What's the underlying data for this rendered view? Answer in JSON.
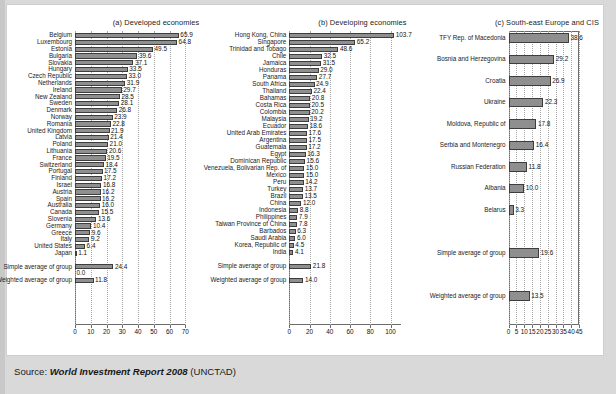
{
  "source": {
    "label": "Source: ",
    "italic_title": "World Investment Report 2008",
    "suffix": " (UNCTAD)"
  },
  "chart_data": [
    {
      "type": "bar",
      "orientation": "horizontal",
      "title": "(a) Developed economies",
      "xlabel": "",
      "ylabel": "",
      "xlim": [
        0,
        70
      ],
      "xticks": [
        0,
        10,
        20,
        30,
        40,
        50,
        60,
        70
      ],
      "grid": true,
      "categories": [
        "Belgium",
        "Luxembourg",
        "Estonia",
        "Bulgaria",
        "Slovakia",
        "Hungary",
        "Czech Republic",
        "Netherlands",
        "Ireland",
        "New Zealand",
        "Sweden",
        "Denmark",
        "Norway",
        "Romania",
        "United Kingdom",
        "Latvia",
        "Poland",
        "Lithuania",
        "France",
        "Switzerland",
        "Portugal",
        "Finland",
        "Israel",
        "Austria",
        "Spain",
        "Australia",
        "Canada",
        "Slovenia",
        "Germany",
        "Greece",
        "Italy",
        "United States",
        "Japan",
        "",
        "Simple average of group",
        "",
        "Weighted average of group"
      ],
      "values": [
        65.9,
        64.8,
        49.5,
        39.6,
        37.1,
        33.5,
        33.0,
        31.9,
        29.7,
        28.5,
        28.1,
        26.8,
        23.9,
        22.8,
        21.9,
        21.4,
        21.0,
        20.6,
        19.5,
        18.4,
        17.5,
        17.2,
        16.8,
        16.2,
        16.2,
        16.0,
        15.5,
        13.6,
        10.4,
        9.6,
        9.2,
        6.4,
        1.1,
        null,
        24.4,
        0.0,
        11.8
      ],
      "labels": [
        "65.9",
        "64.8",
        "49.5",
        "39.6",
        "37.1",
        "33.5",
        "33.0",
        "31.9",
        "29.7",
        "28.5",
        "28.1",
        "26.8",
        "23.9",
        "22.8",
        "21.9",
        "21.4",
        "21.0",
        "20.6",
        "19.5",
        "18.4",
        "17.5",
        "17.2",
        "16.8",
        "16.2",
        "16.2",
        "16.0",
        "15.5",
        "13.6",
        "10.4",
        "9.6",
        "9.2",
        "6.4",
        "1.1",
        "",
        "24.4",
        "0.0",
        "11.8"
      ]
    },
    {
      "type": "bar",
      "orientation": "horizontal",
      "title": "(b) Developing economies",
      "xlabel": "",
      "ylabel": "",
      "xlim": [
        0,
        110
      ],
      "xticks": [
        0,
        20,
        40,
        60,
        80,
        100
      ],
      "grid": true,
      "categories": [
        "Hong Kong, China",
        "Singapore",
        "Trinidad and Tobago",
        "Chile",
        "Jamaica",
        "Honduras",
        "Panama",
        "South Africa",
        "Thailand",
        "Bahamas",
        "Costa Rica",
        "Colombia",
        "Malaysia",
        "Ecuador",
        "United Arab Emirates",
        "Argentina",
        "Guatemala",
        "Egypt",
        "Dominican Republic",
        "Venezuela, Bolivarian Rep. of",
        "Mexico",
        "Peru",
        "Turkey",
        "Brazil",
        "China",
        "Indonesia",
        "Philippines",
        "Taiwan Province of China",
        "Barbados",
        "Saudi Arabia",
        "Korea, Republic of",
        "India",
        "",
        "Simple average of group",
        "",
        "Weighted average of group"
      ],
      "values": [
        103.7,
        65.2,
        48.6,
        32.5,
        31.5,
        29.0,
        27.7,
        24.9,
        22.4,
        20.8,
        20.5,
        20.2,
        19.2,
        18.6,
        17.6,
        17.5,
        17.2,
        16.3,
        15.6,
        15.0,
        15.0,
        14.2,
        13.7,
        13.5,
        12.0,
        8.8,
        7.9,
        7.8,
        6.3,
        6.0,
        4.5,
        4.1,
        null,
        21.8,
        null,
        14.0
      ],
      "labels": [
        "103.7",
        "65.2",
        "48.6",
        "32.5",
        "31.5",
        "29.0",
        "27.7",
        "24.9",
        "22.4",
        "20.8",
        "20.5",
        "20.2",
        "19.2",
        "18.6",
        "17.6",
        "17.5",
        "17.2",
        "16.3",
        "15.6",
        "15.0",
        "15.0",
        "14.2",
        "13.7",
        "13.5",
        "12.0",
        "8.8",
        "7.9",
        "7.8",
        "6.3",
        "6.0",
        "4.5",
        "4.1",
        "",
        "21.8",
        "",
        "14.0"
      ]
    },
    {
      "type": "bar",
      "orientation": "horizontal",
      "title": "(c) South-east Europe and CIS",
      "xlabel": "",
      "ylabel": "",
      "xlim": [
        0,
        45
      ],
      "xticks": [
        0,
        5,
        10,
        15,
        20,
        25,
        30,
        35,
        40,
        45
      ],
      "grid": true,
      "categories": [
        "TFY Rep. of Macedonia",
        "Bosnia and Herzegovina",
        "Croatia",
        "Ukraine",
        "Moldova, Republic of",
        "Serbia and Montenegro",
        "Russian Federation",
        "Albania",
        "Belarus",
        "",
        "Simple average of group",
        "",
        "Weighted average of group"
      ],
      "values": [
        38.6,
        29.2,
        26.9,
        22.3,
        17.8,
        16.4,
        11.8,
        10.0,
        3.3,
        null,
        19.6,
        null,
        13.5
      ],
      "labels": [
        "38.6",
        "29.2",
        "26.9",
        "22.3",
        "17.8",
        "16.4",
        "11.8",
        "10.0",
        "3.3",
        "",
        "19.6",
        "",
        "13.5"
      ]
    }
  ]
}
